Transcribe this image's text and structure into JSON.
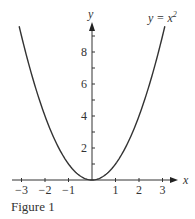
{
  "chart_data": {
    "type": "line",
    "title": "",
    "caption": "Figure 1",
    "annotation": "y = x",
    "annotation_sup": "2",
    "xlabel": "x",
    "ylabel": "y",
    "xlim": [
      -3.2,
      3.4
    ],
    "ylim": [
      0,
      9.5
    ],
    "grid": false,
    "legend": "none",
    "x_ticks": [
      -3,
      -2,
      -1,
      1,
      2,
      3
    ],
    "x_tick_labels": [
      "−3",
      "−2",
      "−1",
      "1",
      "2",
      "3"
    ],
    "y_ticks": [
      1,
      2,
      3,
      4,
      5,
      6,
      7,
      8,
      9
    ],
    "y_tick_labels": [
      "2",
      "4",
      "6",
      "8"
    ],
    "series": [
      {
        "name": "y = x^2",
        "x": [
          -3.1,
          -3,
          -2.5,
          -2,
          -1.5,
          -1,
          -0.5,
          0,
          0.5,
          1,
          1.5,
          2,
          2.5,
          3,
          3.1
        ],
        "values": [
          9.61,
          9,
          6.25,
          4,
          2.25,
          1,
          0.25,
          0,
          0.25,
          1,
          2.25,
          4,
          6.25,
          9,
          9.61
        ]
      }
    ]
  }
}
